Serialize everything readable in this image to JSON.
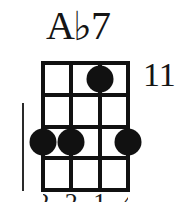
{
  "diagram": {
    "type": "chord-diagram",
    "instrument_strings": 4,
    "title": {
      "full": "A♭7",
      "root": "A",
      "accidental": "♭",
      "quality": "7"
    },
    "fret_position": "11",
    "grid": {
      "strings": 4,
      "fret_lines": 5,
      "fret_spaces": 4,
      "string_x": [
        0,
        28.33,
        56.67,
        85
      ],
      "fret_y": [
        0,
        31.75,
        63.5,
        95.25,
        127
      ]
    },
    "dots": [
      {
        "label": "dot-string-3-fret-1",
        "string": 3,
        "fret": 1,
        "x": 56.67,
        "y": 15.9
      },
      {
        "label": "dot-string-1-fret-3",
        "string": 1,
        "fret": 3,
        "x": 0,
        "y": 79.4
      },
      {
        "label": "dot-string-2-fret-3",
        "string": 2,
        "fret": 3,
        "x": 28.33,
        "y": 79.4
      },
      {
        "label": "dot-string-4-fret-3",
        "string": 4,
        "fret": 3,
        "x": 85,
        "y": 79.4
      }
    ],
    "fingering": [
      {
        "string": 1,
        "number": "2",
        "x": 0
      },
      {
        "string": 2,
        "number": "2",
        "x": 28.33
      },
      {
        "string": 3,
        "number": "1",
        "x": 56.67
      },
      {
        "string": 4,
        "number": "4",
        "x": 85
      }
    ],
    "colors": {
      "ink": "#111111",
      "text": "#151515",
      "background": "#ffffff"
    }
  }
}
